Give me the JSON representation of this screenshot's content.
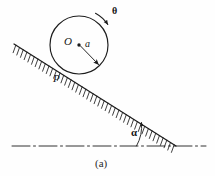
{
  "figure": {
    "caption": "(a)",
    "labels": {
      "center": "O",
      "radius": "a",
      "contact_point": "P",
      "rotation_angle": "θ",
      "incline_angle": "α"
    },
    "colors": {
      "ink": "#1c1c1c",
      "background": "#fefefe",
      "hatch": "#262626"
    },
    "geometry": {
      "circle": {
        "cx": 79,
        "cy": 45,
        "r": 29
      },
      "center_dot": {
        "cx": 79,
        "cy": 45,
        "r": 1.6
      },
      "radius_arrow": {
        "x1": 79,
        "y1": 45,
        "x2": 99,
        "y2": 65
      },
      "incline": {
        "x1": 14,
        "y1": 44,
        "x2": 176,
        "y2": 146
      },
      "baseline": {
        "x1": 12,
        "y1": 146,
        "x2": 206,
        "y2": 146
      },
      "baseline_style": "dash-dot",
      "hatch_count": 44,
      "hatch_length": 8,
      "theta_arc": {
        "cx": 79,
        "cy": 45,
        "r": 35,
        "start_deg": -74,
        "end_deg": -40
      },
      "alpha_arc": {
        "cx": 176,
        "cy": 146,
        "r": 40,
        "start_deg": 180,
        "end_deg": 212
      },
      "contact_point": {
        "x": 64,
        "y": 70
      }
    },
    "icons": {
      "theta_arrow": "curved-arrow-clockwise",
      "radius_arrow": "straight-arrow",
      "alpha_arrow": "curved-arrow-ccw"
    }
  }
}
